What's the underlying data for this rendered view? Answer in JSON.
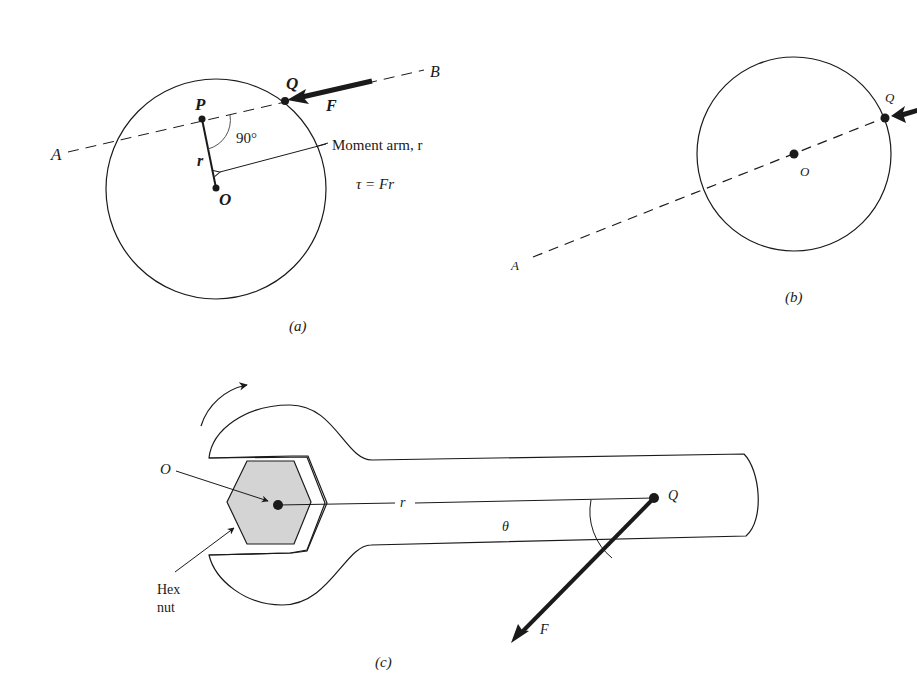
{
  "figure_a": {
    "caption": "(a)",
    "point_P": "P",
    "point_Q": "Q",
    "point_O": "O",
    "point_A": "A",
    "point_B": "B",
    "force_label": "F",
    "angle_label": "90°",
    "radius_label": "r",
    "moment_arm_label": "Moment arm, r",
    "equation": "τ = Fr"
  },
  "figure_b": {
    "caption": "(b)",
    "point_Q": "Q",
    "point_O": "O",
    "point_A": "A"
  },
  "figure_c": {
    "caption": "(c)",
    "point_O": "O",
    "point_Q": "Q",
    "radius_label": "r",
    "angle_label": "θ",
    "force_label": "F",
    "hex_nut_line1": "Hex",
    "hex_nut_line2": "nut"
  },
  "colors": {
    "stroke": "#1a1a1a",
    "nut_fill": "#d4d4d4",
    "background": "#ffffff"
  }
}
